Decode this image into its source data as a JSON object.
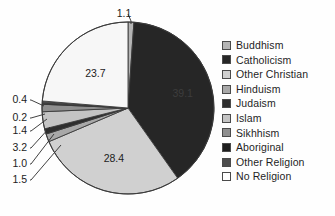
{
  "chart_data": {
    "type": "pie",
    "title": "",
    "subtitle": "",
    "xlabel": "",
    "ylabel": "",
    "legend_position": "right",
    "grid": false,
    "units": "percent",
    "total": 100.0,
    "start_angle_deg": 0,
    "direction": "clockwise",
    "categories": [
      "Buddhism",
      "Catholicism",
      "Other Christian",
      "Hinduism",
      "Judaism",
      "Islam",
      "Sikhhism",
      "Aboriginal",
      "Other Religion",
      "No Religion"
    ],
    "values": [
      1.1,
      39.1,
      28.4,
      1.5,
      1.0,
      3.2,
      1.4,
      0.2,
      0.4,
      23.7
    ],
    "value_labels": [
      "1.1",
      "39.1",
      "28.4",
      "1.5",
      "1.0",
      "3.2",
      "1.4",
      "0.2",
      "0.4",
      "23.7"
    ],
    "colors": [
      "#b4b4b4",
      "#262626",
      "#d0d0d0",
      "#a8a8a8",
      "#2e2e2e",
      "#c4c4c4",
      "#8f8f8f",
      "#1e1e1e",
      "#4d4d4d",
      "#f7f7f7"
    ],
    "slices": [
      {
        "label": "Buddhism",
        "value": 1.1,
        "value_label": "1.1",
        "color": "#b4b4b4",
        "label_placement": "outside-callout"
      },
      {
        "label": "Catholicism",
        "value": 39.1,
        "value_label": "39.1",
        "color": "#262626",
        "label_placement": "inside"
      },
      {
        "label": "Other Christian",
        "value": 28.4,
        "value_label": "28.4",
        "color": "#d0d0d0",
        "label_placement": "inside"
      },
      {
        "label": "Hinduism",
        "value": 1.5,
        "value_label": "1.5",
        "color": "#a8a8a8",
        "label_placement": "outside-callout"
      },
      {
        "label": "Judaism",
        "value": 1.0,
        "value_label": "1.0",
        "color": "#2e2e2e",
        "label_placement": "outside-callout"
      },
      {
        "label": "Islam",
        "value": 3.2,
        "value_label": "3.2",
        "color": "#c4c4c4",
        "label_placement": "outside-callout"
      },
      {
        "label": "Sikhhism",
        "value": 1.4,
        "value_label": "1.4",
        "color": "#8f8f8f",
        "label_placement": "outside-callout"
      },
      {
        "label": "Aboriginal",
        "value": 0.2,
        "value_label": "0.2",
        "color": "#1e1e1e",
        "label_placement": "outside-callout"
      },
      {
        "label": "Other Religion",
        "value": 0.4,
        "value_label": "0.4",
        "color": "#4d4d4d",
        "label_placement": "outside-callout"
      },
      {
        "label": "No Religion",
        "value": 23.7,
        "value_label": "23.7",
        "color": "#f7f7f7",
        "label_placement": "inside"
      }
    ]
  },
  "legend": {
    "items": [
      {
        "label": "Buddhism",
        "swatch": "#b4b4b4"
      },
      {
        "label": "Catholicism",
        "swatch": "#262626"
      },
      {
        "label": "Other Christian",
        "swatch": "#d0d0d0"
      },
      {
        "label": "Hinduism",
        "swatch": "#a8a8a8"
      },
      {
        "label": "Judaism",
        "swatch": "#2e2e2e"
      },
      {
        "label": "Islam",
        "swatch": "#c4c4c4"
      },
      {
        "label": "Sikhhism",
        "swatch": "#8f8f8f"
      },
      {
        "label": "Aboriginal",
        "swatch": "#1e1e1e"
      },
      {
        "label": "Other Religion",
        "swatch": "#4d4d4d"
      },
      {
        "label": "No Religion",
        "swatch": "#ffffff"
      }
    ]
  },
  "style": {
    "background": "#fefefe",
    "outline": "#3a3a3a",
    "label_text": "#1c1c1c"
  }
}
